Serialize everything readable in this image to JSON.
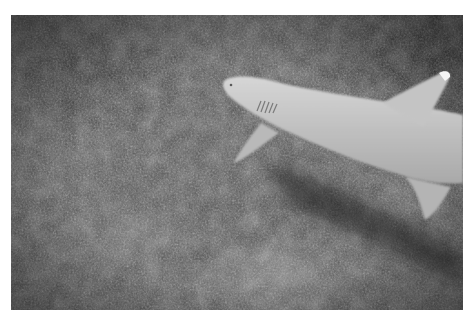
{
  "image": {
    "description": "Grayscale underwater photograph of a whitetip reef shark swimming over a rocky, pebbly seabed",
    "subject": "whitetip reef shark",
    "background": "rocky seabed",
    "colors": {
      "frame": "#ffffff",
      "seabed": "#4a4a4a",
      "shark_body": "#c8c8c8",
      "fin_tip": "#f2f2f2",
      "shadow": "#1e1e1e"
    }
  }
}
